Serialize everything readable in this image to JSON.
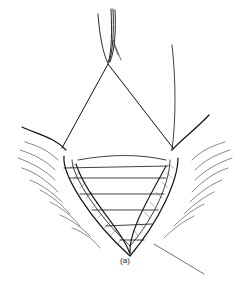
{
  "figure": {
    "caption": "(a)",
    "colors": {
      "ink": "#111111",
      "background": "#ffffff"
    }
  }
}
